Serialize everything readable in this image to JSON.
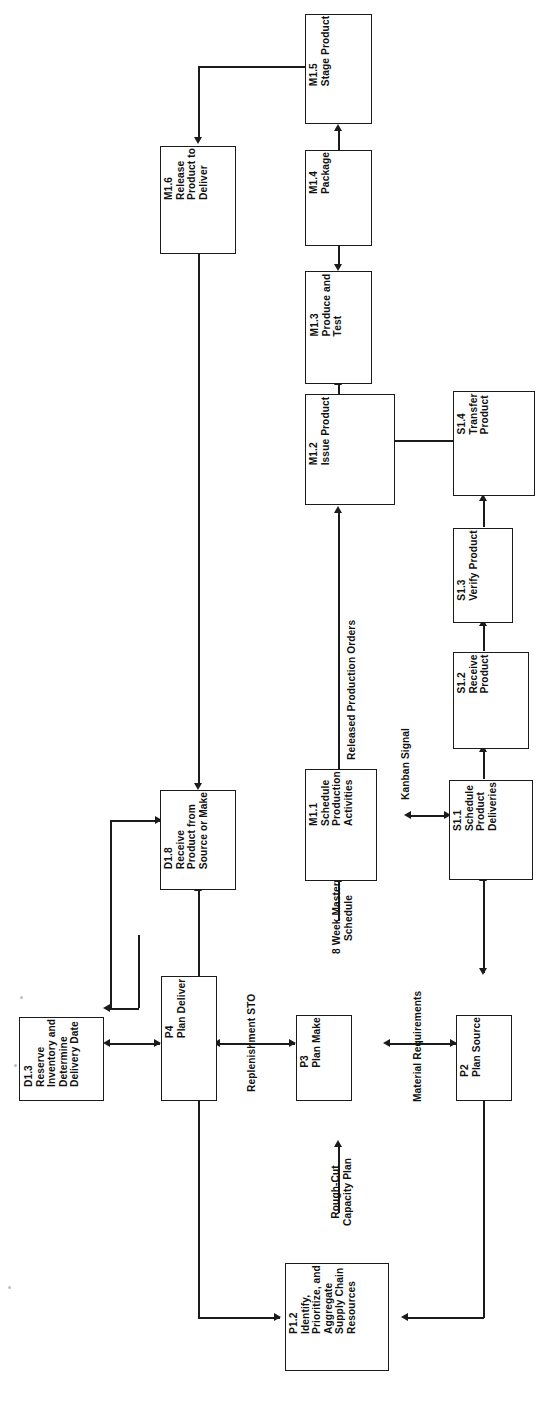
{
  "diagram": {
    "orientation": "rotated-90-ccw",
    "line_color": "#1b1b1b",
    "text_color": "#111111",
    "background": "#ffffff",
    "nodes": [
      {
        "id": "M1_5",
        "code": "M1.5",
        "label": "Stage Product",
        "text": "M1.5\nStage Product"
      },
      {
        "id": "M1_6",
        "code": "M1.6",
        "label": "Release Product to Deliver",
        "text": "M1.6\nRelease\nProduct to\nDeliver"
      },
      {
        "id": "M1_4",
        "code": "M1.4",
        "label": "Package",
        "text": "M1.4\nPackage"
      },
      {
        "id": "M1_3",
        "code": "M1.3",
        "label": "Produce and Test",
        "text": "M1.3\nProduce and\nTest"
      },
      {
        "id": "M1_2",
        "code": "M1.2",
        "label": "Issue Product",
        "text": "M1.2\nIssue Product"
      },
      {
        "id": "S1_4",
        "code": "S1.4",
        "label": "Transfer Product",
        "text": "S1.4\nTransfer\nProduct"
      },
      {
        "id": "S1_3",
        "code": "S1.3",
        "label": "Verify Product",
        "text": "S1.3\nVerify Product"
      },
      {
        "id": "S1_2",
        "code": "S1.2",
        "label": "Receive Product",
        "text": "S1.2\nReceive\nProduct"
      },
      {
        "id": "S1_1",
        "code": "S1.1",
        "label": "Schedule Product Deliveries",
        "text": "S1.1\nSchedule\nProduct\nDeliveries"
      },
      {
        "id": "M1_1",
        "code": "M1.1",
        "label": "Schedule Production Activities",
        "text": "M1.1\nSchedule\nProduction\nActivities"
      },
      {
        "id": "D1_8",
        "code": "D1.8",
        "label": "Receive Product from Source or Make",
        "text": "D1.8\nReceive\nProduct from\nSource or Make"
      },
      {
        "id": "D1_3",
        "code": "D1.3",
        "label": "Reserve Inventory and Determine Delivery Date",
        "text": "D1.3\nReserve\nInventory and\nDetermine\nDelivery Date"
      },
      {
        "id": "P4",
        "code": "P4",
        "label": "Plan Deliver",
        "text": "P4\nPlan Deliver"
      },
      {
        "id": "P3",
        "code": "P3",
        "label": "Plan Make",
        "text": "P3\nPlan Make"
      },
      {
        "id": "P2",
        "code": "P2",
        "label": "Plan Source",
        "text": "P2\nPlan Source"
      },
      {
        "id": "P1_2",
        "code": "P1.2",
        "label": "Identify, Prioritize, and Aggregate Supply Chain Resources",
        "text": "P1.2\nIdentify,\nPrioritize, and\nAggregate\nSupply Chain\nResources"
      }
    ],
    "edge_labels": [
      {
        "id": "released_production_orders",
        "text": "Released Production Orders"
      },
      {
        "id": "kanban_signal",
        "text": "Kanban Signal"
      },
      {
        "id": "replenishment_sto",
        "text": "Replenishment STO"
      },
      {
        "id": "eight_week_master_schedule",
        "text": "8 Week Master\nSchedule"
      },
      {
        "id": "material_requirements",
        "text": "Material Requirements"
      },
      {
        "id": "rough_cut_capacity_plan",
        "text": "Rough-Cut\nCapacity Plan"
      }
    ]
  }
}
